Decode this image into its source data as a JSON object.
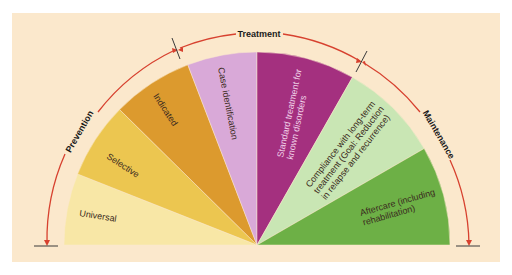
{
  "diagram": {
    "title": "",
    "phases": [
      {
        "id": "prevention",
        "label": "Prevention"
      },
      {
        "id": "treatment",
        "label": "Treatment"
      },
      {
        "id": "maintenance",
        "label": "Maintenance"
      }
    ],
    "segments": [
      {
        "id": "universal",
        "label": "Universal",
        "color": "#f8e7a6",
        "phase": "prevention"
      },
      {
        "id": "selective",
        "label": "Selective",
        "color": "#ecc650",
        "phase": "prevention"
      },
      {
        "id": "indicated",
        "label": "Indicated",
        "color": "#dc9a2e",
        "phase": "prevention"
      },
      {
        "id": "case-identification",
        "label": "Case identification",
        "color": "#d9a9d8",
        "phase": "treatment"
      },
      {
        "id": "standard-treatment",
        "label_lines": [
          "Standard treatment for",
          "known disorders"
        ],
        "color": "#a4307f",
        "phase": "treatment"
      },
      {
        "id": "compliance",
        "label_lines": [
          "Compliance with long-term",
          "treatment (Goal: Reduction",
          "in relapse and recurrence)"
        ],
        "color": "#c9e6b4",
        "phase": "maintenance"
      },
      {
        "id": "aftercare",
        "label_lines": [
          "Aftercare (including",
          "rehabilitation)"
        ],
        "color": "#6db046",
        "phase": "maintenance"
      }
    ],
    "colors": {
      "background": "#fbe8cc",
      "arc": "#d7412f",
      "tick": "#3a3a3a"
    }
  }
}
